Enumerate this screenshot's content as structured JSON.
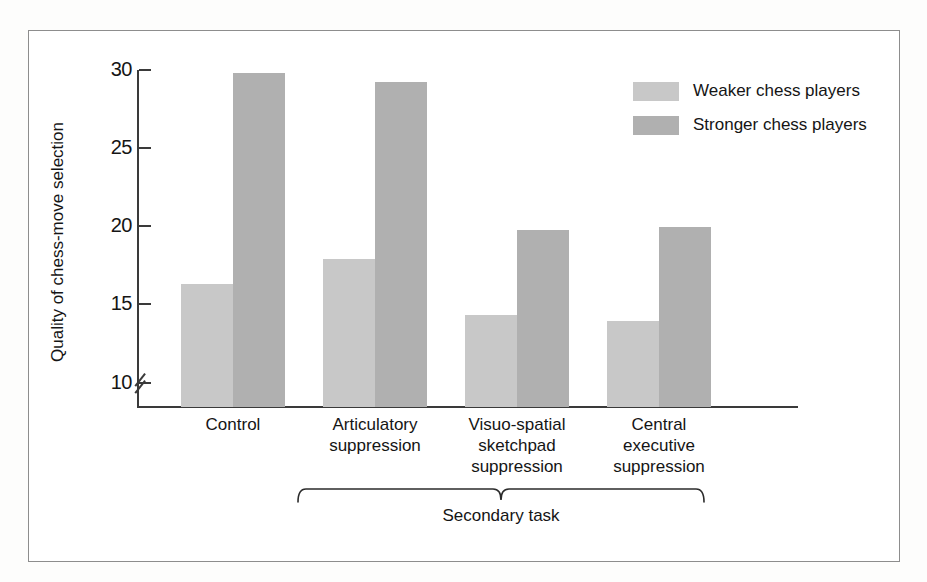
{
  "chart_data": {
    "type": "bar",
    "title": "",
    "xlabel": "",
    "ylabel": "Quality of chess-move selection",
    "categories": [
      "Control",
      "Articulatory suppression",
      "Visuo-spatial sketchpad suppression",
      "Central executive suppression"
    ],
    "series": [
      {
        "name": "Weaker chess players",
        "color": "#c8c8c8",
        "values": [
          16.4,
          18.0,
          14.4,
          14.0
        ]
      },
      {
        "name": "Stronger chess players",
        "color": "#b0b0b0",
        "values": [
          29.9,
          29.3,
          19.8,
          20.0
        ]
      }
    ],
    "yticks": [
      10,
      15,
      20,
      25,
      30
    ],
    "ytick_labels": [
      "10",
      "15",
      "20",
      "25",
      "30"
    ],
    "ylim": [
      8.5,
      30
    ],
    "axis_break": true,
    "grid": false,
    "legend_position": "top-right",
    "annotations": [
      {
        "text": "Secondary task",
        "spans_categories": [
          1,
          2,
          3
        ],
        "style": "brace-below"
      }
    ]
  },
  "axis": {
    "y_title": "Quality of chess-move selection",
    "ticks": [
      {
        "label": "30",
        "value": 30
      },
      {
        "label": "25",
        "value": 25
      },
      {
        "label": "20",
        "value": 20
      },
      {
        "label": "15",
        "value": 15
      },
      {
        "label": "10",
        "value": 10
      }
    ],
    "break_marker": "axis-break-double-slash"
  },
  "categories": [
    {
      "lines": [
        "Control"
      ]
    },
    {
      "lines": [
        "Articulatory",
        "suppression"
      ]
    },
    {
      "lines": [
        "Visuo-spatial",
        "sketchpad",
        "suppression"
      ]
    },
    {
      "lines": [
        "Central",
        "executive",
        "suppression"
      ]
    }
  ],
  "legend": {
    "items": [
      {
        "label": "Weaker chess players",
        "color": "#c8c8c8"
      },
      {
        "label": "Stronger chess players",
        "color": "#b0b0b0"
      }
    ]
  },
  "annotation": {
    "secondary_task_label": "Secondary task"
  }
}
